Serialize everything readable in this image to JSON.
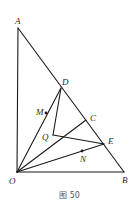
{
  "caption": "图 50",
  "points": {
    "A": {
      "label": "A",
      "x": 18,
      "y": 28
    },
    "O": {
      "label": "O",
      "x": 17,
      "y": 172
    },
    "B": {
      "label": "B",
      "x": 124,
      "y": 172
    },
    "D": {
      "label": "D",
      "x": 61,
      "y": 88
    },
    "C": {
      "label": "C",
      "x": 86,
      "y": 120
    },
    "E": {
      "label": "E",
      "x": 104,
      "y": 144
    },
    "Q": {
      "label": "Q",
      "x": 53,
      "y": 135
    },
    "M": {
      "label": "M",
      "x": 46,
      "y": 113
    },
    "N": {
      "label": "N",
      "x": 82,
      "y": 151
    }
  },
  "segments": [
    [
      "A",
      "O"
    ],
    [
      "O",
      "B"
    ],
    [
      "A",
      "B"
    ],
    [
      "O",
      "D"
    ],
    [
      "D",
      "Q"
    ],
    [
      "Q",
      "E"
    ],
    [
      "O",
      "C"
    ],
    [
      "O",
      "E"
    ]
  ],
  "colors": {
    "stroke": "#1a1a1a",
    "text": "#2a2a2a"
  }
}
